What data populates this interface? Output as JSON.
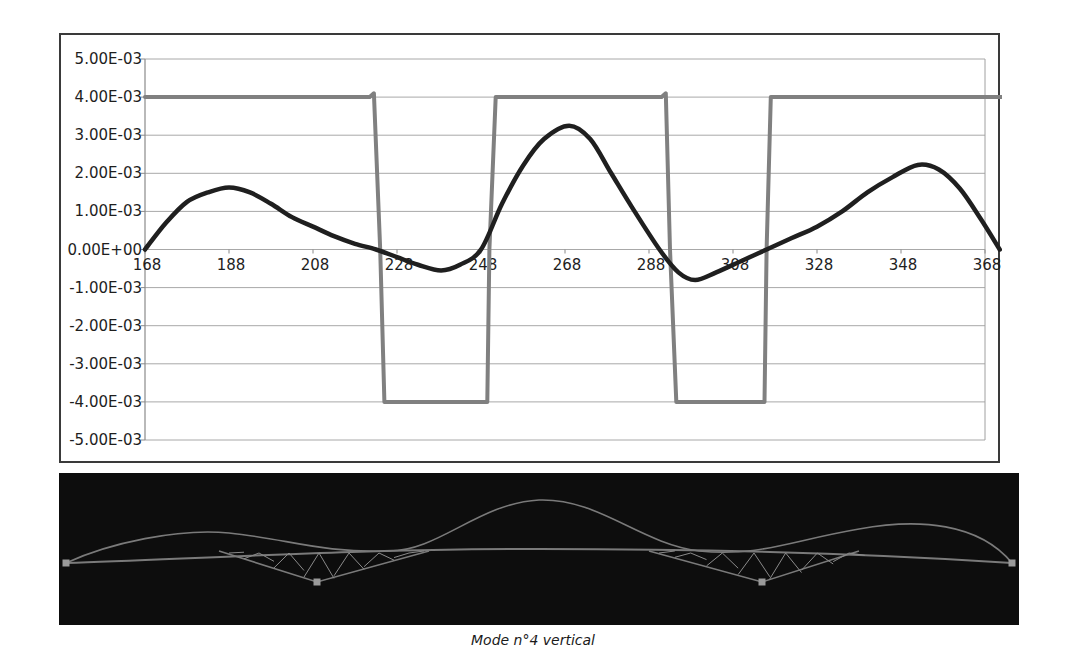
{
  "chart_data": {
    "type": "line",
    "title": "",
    "xlabel": "",
    "ylabel": "",
    "x_ticks": [
      "168",
      "188",
      "208",
      "228",
      "248",
      "268",
      "288",
      "308",
      "328",
      "348",
      "368"
    ],
    "y_ticks": [
      "5.00E-03",
      "4.00E-03",
      "3.00E-03",
      "2.00E-03",
      "1.00E-03",
      "0.00E+00",
      "-1.00E-03",
      "-2.00E-03",
      "-3.00E-03",
      "-4.00E-03",
      "-5.00E-03"
    ],
    "y_tick_values": [
      0.005,
      0.004,
      0.003,
      0.002,
      0.001,
      0,
      -0.001,
      -0.002,
      -0.003,
      -0.004,
      -0.005
    ],
    "xlim": [
      168,
      372
    ],
    "ylim": [
      -0.005,
      0.005
    ],
    "grid": "horizontal",
    "legend": "none",
    "series": [
      {
        "name": "mode shape",
        "color": "#1f1f1f",
        "x": [
          168,
          173,
          178,
          183,
          188,
          193,
          198,
          203,
          208,
          213,
          218,
          223,
          228,
          233,
          238.5,
          243,
          248,
          253,
          258,
          263,
          269,
          274,
          279,
          284,
          290.5,
          295,
          299,
          304,
          310,
          316,
          322,
          328,
          334,
          340,
          346,
          352,
          357,
          362,
          367,
          371.5
        ],
        "values": [
          0,
          0.0007,
          0.00125,
          0.0015,
          0.00163,
          0.0015,
          0.0012,
          0.00085,
          0.0006,
          0.00035,
          0.00015,
          0,
          -0.0002,
          -0.0004,
          -0.00055,
          -0.0004,
          0,
          0.0012,
          0.0022,
          0.0029,
          0.00325,
          0.0029,
          0.002,
          0.0011,
          0,
          -0.0006,
          -0.0008,
          -0.0006,
          -0.0003,
          0,
          0.0003,
          0.0006,
          0.001,
          0.0015,
          0.0019,
          0.00222,
          0.0021,
          0.0016,
          0.0008,
          0
        ]
      },
      {
        "name": "sign indicator",
        "color": "#808080",
        "x": [
          168,
          221.5,
          222.5,
          224,
          225,
          249.5,
          250,
          251.5,
          291,
          292,
          293,
          294.5,
          315.5,
          316,
          317,
          372
        ],
        "values": [
          0.004,
          0.004,
          0.0041,
          0.0,
          -0.004,
          -0.004,
          0.0,
          0.004,
          0.004,
          0.0041,
          0.0,
          -0.004,
          -0.004,
          0.0,
          0.004,
          0.004
        ]
      }
    ]
  },
  "mode_view": {
    "background": "#0d0d0d",
    "line_color": "#7a7a7a",
    "support_color": "#9a9a9a"
  },
  "caption": "Mode n°4 vertical"
}
